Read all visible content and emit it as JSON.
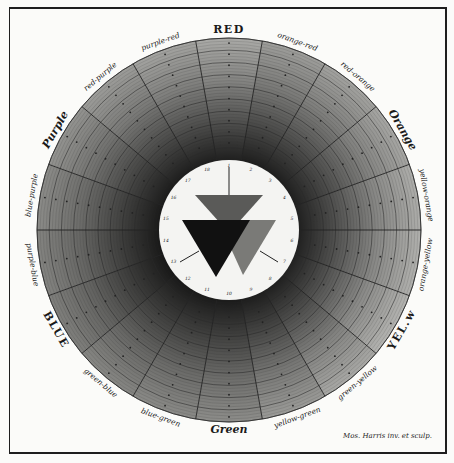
{
  "plate": {
    "title_top": "RED",
    "signature": "Mos. Harris inv. et sculp.",
    "wheel": {
      "center": [
        229,
        230
      ],
      "outer_radius": 192,
      "inner_radius": 70,
      "sector_count": 18,
      "ring_count": 10
    },
    "sectors": [
      {
        "label": "RED",
        "style": "cap",
        "tone": "#a9a9a6"
      },
      {
        "label": "orange-red",
        "style": "lbl",
        "tone": "#9d9d9a"
      },
      {
        "label": "red-orange",
        "style": "lbl",
        "tone": "#a2a29f"
      },
      {
        "label": "Orange",
        "style": "capital-italic",
        "tone": "#a6a6a3"
      },
      {
        "label": "yellow-orange",
        "style": "lbl",
        "tone": "#adadaa"
      },
      {
        "label": "orange-yellow",
        "style": "lbl",
        "tone": "#b0b0ad"
      },
      {
        "label": "YEL.w",
        "style": "cap",
        "tone": "#b3b3b0"
      },
      {
        "label": "green-yellow",
        "style": "lbl",
        "tone": "#a8a8a5"
      },
      {
        "label": "yellow-green",
        "style": "lbl",
        "tone": "#9a9a97"
      },
      {
        "label": "Green",
        "style": "capital-italic",
        "tone": "#8d8d8a"
      },
      {
        "label": "blue-green",
        "style": "lbl",
        "tone": "#8a8a87"
      },
      {
        "label": "green-blue",
        "style": "lbl",
        "tone": "#868683"
      },
      {
        "label": "BLUE",
        "style": "cap",
        "tone": "#7f7f7c"
      },
      {
        "label": "purple-blue",
        "style": "lbl",
        "tone": "#838380"
      },
      {
        "label": "blue-purple",
        "style": "lbl",
        "tone": "#8b8b88"
      },
      {
        "label": "Purple",
        "style": "capital-italic",
        "tone": "#939390"
      },
      {
        "label": "red-purple",
        "style": "lbl",
        "tone": "#9c9c99"
      },
      {
        "label": "purple-red",
        "style": "lbl",
        "tone": "#a3a3a0"
      }
    ],
    "center_dial": {
      "background": "#f4f4f2",
      "tick_numbers": [
        "1",
        "2",
        "3",
        "4",
        "5",
        "6",
        "7",
        "8",
        "9",
        "10",
        "11",
        "12",
        "13",
        "14",
        "15",
        "16",
        "17",
        "18"
      ],
      "triangles": [
        {
          "name": "top",
          "fill": "#5a5a58"
        },
        {
          "name": "left",
          "fill": "#111111"
        },
        {
          "name": "right",
          "fill": "#7a7a77"
        }
      ]
    },
    "colors": {
      "ink": "#1a1a1a",
      "paper": "#fbfbf9",
      "ring_line": "#2a2a2a",
      "dark_core": "#1c1c1c"
    }
  }
}
